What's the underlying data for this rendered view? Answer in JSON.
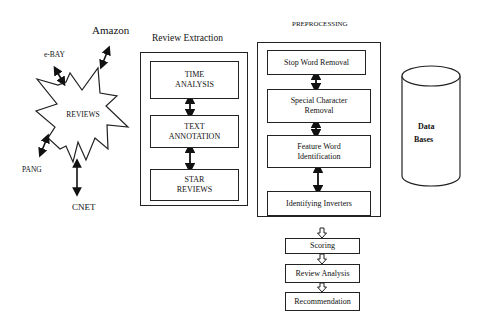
{
  "sources": {
    "center_label": "REVIEWS",
    "items": [
      "Amazon",
      "e-BAY",
      "PANG",
      "CNET"
    ]
  },
  "review_extraction": {
    "title": "Review Extraction",
    "steps": [
      {
        "line1": "TIME",
        "line2": "ANALYSIS"
      },
      {
        "line1": "TEXT",
        "line2": "ANNOTATION"
      },
      {
        "line1": "STAR",
        "line2": "REVIEWS"
      }
    ]
  },
  "preprocessing": {
    "title": "PREPROCESSING",
    "steps": [
      {
        "line1": "Stop Word Removal",
        "line2": ""
      },
      {
        "line1": "Special Character",
        "line2": "Removal"
      },
      {
        "line1": "Feature Word",
        "line2": "Identification"
      },
      {
        "line1": "Identifying Inverters",
        "line2": ""
      }
    ]
  },
  "pipeline": {
    "steps": [
      "Scoring",
      "Review Analysis",
      "Recommendation"
    ]
  },
  "database": {
    "line1": "Data",
    "line2": "Bases"
  }
}
